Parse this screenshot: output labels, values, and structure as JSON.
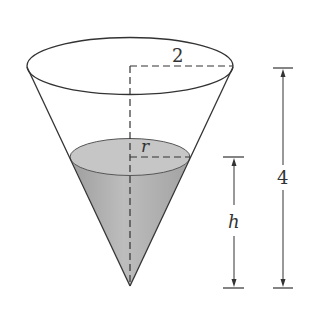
{
  "diagram": {
    "type": "conical tank partially filled with liquid",
    "labels": {
      "top_radius": "2",
      "liquid_radius": "r",
      "liquid_height": "h",
      "total_height": "4"
    },
    "colors": {
      "outline": "#333333",
      "liquid_surface": "#c6c6c6",
      "liquid_body": "#b0b0b0",
      "background": "#ffffff"
    }
  }
}
